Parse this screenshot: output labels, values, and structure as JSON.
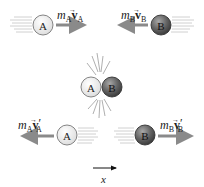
{
  "figure": {
    "colors": {
      "ball_a_fill": "#f2f2f2",
      "ball_a_stroke": "#777777",
      "ball_b_fill": "#6a6a6a",
      "ball_b_stroke": "#333333",
      "momentum_arrow": "#8a8a8a",
      "speed_lines": "#bdbdbd",
      "axis_arrow": "#111111"
    },
    "before": {
      "ball_a": {
        "label": "A",
        "direction": "right"
      },
      "ball_b": {
        "label": "B",
        "direction": "left"
      },
      "momentum_a": {
        "mass": "m",
        "mass_sub": "A",
        "vel": "v",
        "vel_sub": "A",
        "prime": ""
      },
      "momentum_b": {
        "mass": "m",
        "mass_sub": "B",
        "vel": "v",
        "vel_sub": "B",
        "prime": ""
      }
    },
    "during": {
      "ball_a": {
        "label": "A"
      },
      "ball_b": {
        "label": "B"
      }
    },
    "after": {
      "ball_a": {
        "label": "A",
        "direction": "left"
      },
      "ball_b": {
        "label": "B",
        "direction": "right"
      },
      "momentum_a": {
        "mass": "m",
        "mass_sub": "A",
        "vel": "v",
        "vel_sub": "A",
        "prime": "′"
      },
      "momentum_b": {
        "mass": "m",
        "mass_sub": "B",
        "vel": "v",
        "vel_sub": "B",
        "prime": "′"
      }
    },
    "axis": {
      "label": "x",
      "direction": "right"
    }
  }
}
